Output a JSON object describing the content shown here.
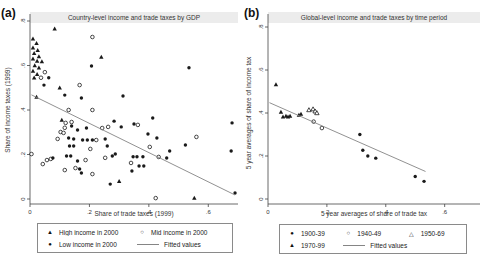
{
  "figure": {
    "panels": [
      {
        "letter": "(a)"
      },
      {
        "letter": "(b)"
      }
    ]
  },
  "chart_data": [
    {
      "type": "scatter",
      "title": "Country-level income and trade taxes by GDP",
      "xlabel": "Share of trade taxes (1999)",
      "ylabel": "Share of income taxes (1999)",
      "xlim": [
        0,
        0.7
      ],
      "ylim": [
        0,
        0.8
      ],
      "grid": false,
      "legend_position": "bottom-boxed",
      "xticks": {
        "values": [
          0,
          0.2,
          0.4,
          0.6
        ],
        "labels": [
          "0",
          ".2",
          ".4",
          ".6"
        ]
      },
      "yticks": {
        "values": [
          0,
          0.2,
          0.4,
          0.6,
          0.8
        ],
        "labels": [
          "0",
          ".2",
          ".4",
          ".6",
          ".8"
        ]
      },
      "legend_rows": [
        [
          0,
          1
        ],
        [
          2,
          3
        ]
      ],
      "series": [
        {
          "name": "High income in 2000",
          "marker": "triangle-filled",
          "points": [
            [
              0.01,
              0.72
            ],
            [
              0.022,
              0.7
            ],
            [
              0.01,
              0.68
            ],
            [
              0.026,
              0.668
            ],
            [
              0.014,
              0.655
            ],
            [
              0.03,
              0.64
            ],
            [
              0.01,
              0.63
            ],
            [
              0.024,
              0.62
            ],
            [
              0.04,
              0.618
            ],
            [
              0.016,
              0.6
            ],
            [
              0.03,
              0.59
            ],
            [
              0.01,
              0.575
            ],
            [
              0.024,
              0.56
            ],
            [
              0.014,
              0.545
            ],
            [
              0.083,
              0.765
            ],
            [
              0.24,
              0.638
            ],
            [
              0.1,
              0.5
            ],
            [
              0.022,
              0.458
            ],
            [
              0.107,
              0.355
            ],
            [
              0.3,
              0.08
            ],
            [
              0.553,
              0.004
            ]
          ]
        },
        {
          "name": "Mid income in 2000",
          "marker": "circle-open",
          "points": [
            [
              0.21,
              0.728
            ],
            [
              0.05,
              0.57
            ],
            [
              0.037,
              0.545
            ],
            [
              0.167,
              0.512
            ],
            [
              0.13,
              0.4
            ],
            [
              0.21,
              0.4
            ],
            [
              0.12,
              0.342
            ],
            [
              0.14,
              0.346
            ],
            [
              0.117,
              0.32
            ],
            [
              0.103,
              0.301
            ],
            [
              0.113,
              0.297
            ],
            [
              0.243,
              0.319
            ],
            [
              0.263,
              0.324
            ],
            [
              0.093,
              0.27
            ],
            [
              0.223,
              0.265
            ],
            [
              0.203,
              0.225
            ],
            [
              0.005,
              0.202
            ],
            [
              0.043,
              0.157
            ],
            [
              0.057,
              0.175
            ],
            [
              0.07,
              0.18
            ],
            [
              0.187,
              0.175
            ],
            [
              0.253,
              0.185
            ],
            [
              0.117,
              0.13
            ],
            [
              0.153,
              0.139
            ],
            [
              0.21,
              0.112
            ],
            [
              0.363,
              0.333
            ],
            [
              0.56,
              0.279
            ],
            [
              0.403,
              0.234
            ],
            [
              0.433,
              0.189
            ],
            [
              0.34,
              0.162
            ],
            [
              0.423,
              0.004
            ]
          ]
        },
        {
          "name": "Low income in 2000",
          "marker": "circle-filled",
          "points": [
            [
              0.047,
              0.512
            ],
            [
              0.063,
              0.545
            ],
            [
              0.117,
              0.467
            ],
            [
              0.173,
              0.454
            ],
            [
              0.313,
              0.463
            ],
            [
              0.207,
              0.598
            ],
            [
              0.535,
              0.59
            ],
            [
              0.14,
              0.328
            ],
            [
              0.16,
              0.31
            ],
            [
              0.19,
              0.319
            ],
            [
              0.283,
              0.35
            ],
            [
              0.307,
              0.324
            ],
            [
              0.13,
              0.274
            ],
            [
              0.147,
              0.27
            ],
            [
              0.177,
              0.265
            ],
            [
              0.193,
              0.265
            ],
            [
              0.21,
              0.265
            ],
            [
              0.253,
              0.27
            ],
            [
              0.133,
              0.238
            ],
            [
              0.147,
              0.238
            ],
            [
              0.26,
              0.238
            ],
            [
              0.077,
              0.184
            ],
            [
              0.123,
              0.193
            ],
            [
              0.137,
              0.193
            ],
            [
              0.16,
              0.171
            ],
            [
              0.277,
              0.193
            ],
            [
              0.287,
              0.202
            ],
            [
              0.167,
              0.135
            ],
            [
              0.173,
              0.117
            ],
            [
              0.27,
              0.067
            ],
            [
              0.413,
              0.364
            ],
            [
              0.35,
              0.337
            ],
            [
              0.68,
              0.342
            ],
            [
              0.397,
              0.292
            ],
            [
              0.427,
              0.274
            ],
            [
              0.523,
              0.243
            ],
            [
              0.677,
              0.216
            ],
            [
              0.347,
              0.19
            ],
            [
              0.36,
              0.19
            ],
            [
              0.38,
              0.19
            ],
            [
              0.46,
              0.184
            ],
            [
              0.47,
              0.216
            ],
            [
              0.367,
              0.148
            ],
            [
              0.383,
              0.148
            ],
            [
              0.343,
              0.126
            ],
            [
              0.69,
              0.027
            ]
          ]
        },
        {
          "name": "Fitted values",
          "marker": "line",
          "points": [
            [
              0.005,
              0.468
            ],
            [
              0.69,
              0.018
            ]
          ]
        }
      ]
    },
    {
      "type": "scatter",
      "title": "Global-level income and trade taxes by time period",
      "xlabel": "5 year averages of share of trade tax",
      "ylabel": "5 year averages of share of income tax",
      "xlim": [
        0,
        0.72
      ],
      "ylim": [
        0,
        0.8
      ],
      "grid": false,
      "legend_position": "bottom-boxed",
      "xticks": {
        "values": [
          0,
          0.2,
          0.4,
          0.6
        ],
        "labels": [
          "0",
          ".2",
          ".4",
          ".6"
        ]
      },
      "yticks": {
        "values": [
          0,
          0.2,
          0.4,
          0.6,
          0.8
        ],
        "labels": [
          "0",
          ".2",
          ".4",
          ".6",
          ".8"
        ]
      },
      "legend_rows": [
        [
          0,
          1,
          2
        ],
        [
          3,
          4
        ]
      ],
      "series": [
        {
          "name": "1900-39",
          "marker": "circle-filled",
          "points": [
            [
              0.312,
              0.3
            ],
            [
              0.322,
              0.227
            ],
            [
              0.339,
              0.2
            ],
            [
              0.366,
              0.19
            ],
            [
              0.5,
              0.105
            ],
            [
              0.53,
              0.082
            ]
          ]
        },
        {
          "name": "1940-49",
          "marker": "circle-open",
          "points": [
            [
              0.155,
              0.36
            ],
            [
              0.183,
              0.33
            ]
          ]
        },
        {
          "name": "1950-69",
          "marker": "triangle-open",
          "points": [
            [
              0.139,
              0.414
            ],
            [
              0.153,
              0.418
            ],
            [
              0.16,
              0.408
            ],
            [
              0.166,
              0.4
            ]
          ]
        },
        {
          "name": "1970-99",
          "marker": "triangle-filled",
          "points": [
            [
              0.027,
              0.532
            ],
            [
              0.044,
              0.405
            ],
            [
              0.051,
              0.382
            ],
            [
              0.061,
              0.386
            ],
            [
              0.068,
              0.382
            ],
            [
              0.075,
              0.386
            ],
            [
              0.105,
              0.39
            ],
            [
              0.112,
              0.395
            ]
          ]
        },
        {
          "name": "Fitted values",
          "marker": "line",
          "points": [
            [
              0.005,
              0.448
            ],
            [
              0.535,
              0.128
            ]
          ]
        }
      ]
    }
  ],
  "colors": {
    "marker": "#1a1a1a",
    "fitted_line": "#858585",
    "title_band": "#ececec",
    "axis": "#444444",
    "background": "#ffffff"
  }
}
